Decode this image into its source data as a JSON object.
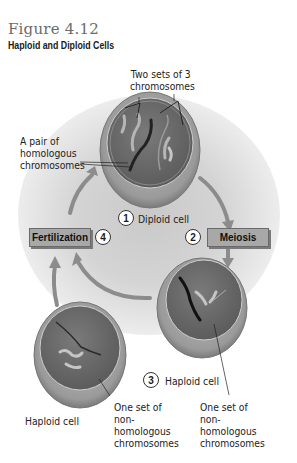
{
  "figure": {
    "number": "Figure 4.12",
    "title": "Haploid and Diploid Cells"
  },
  "labels": {
    "two_sets": "Two sets of 3 chromosomes",
    "pair_homologous": "A pair of homologous chromosomes",
    "haploid_cell_left": "Haploid cell",
    "one_set_left": "One set of non-homologous chromosomes",
    "one_set_right": "One set of non-homologous chromosomes"
  },
  "steps": [
    {
      "number": "1",
      "label": "Diploid cell"
    },
    {
      "number": "2",
      "label": "Meiosis"
    },
    {
      "number": "3",
      "label": "Haploid cell"
    },
    {
      "number": "4",
      "label": "Fertilization"
    }
  ],
  "colors": {
    "cell_fill": "#6e6e6e",
    "cell_rim": "#9a9a9a",
    "arrow": "#8c8c8c",
    "box_fill": "#a8a8a8"
  }
}
